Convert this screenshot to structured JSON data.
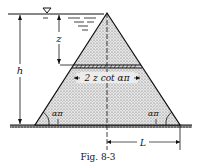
{
  "figure": {
    "caption": "Fig. 8-3",
    "labels": {
      "depth": "z",
      "height": "h",
      "width_expr": "2 z cot απ",
      "angle_left": "απ",
      "angle_right": "απ",
      "half_base": "L"
    },
    "symbols": {
      "water_surface": "▽"
    }
  }
}
